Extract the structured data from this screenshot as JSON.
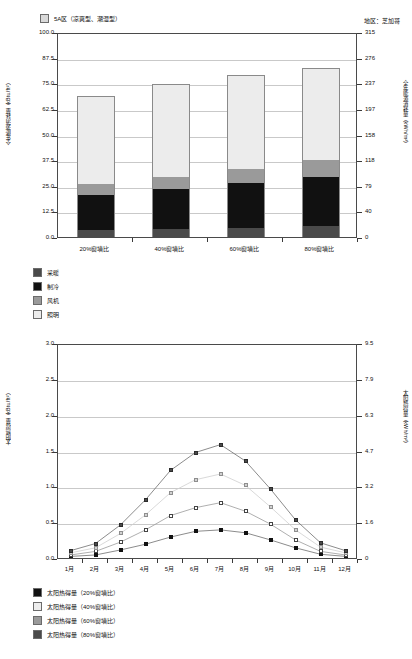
{
  "top": {
    "legend_top": {
      "swatch_color": "#d9d9d9",
      "label": "5A区（凉爽型、潮湿型）"
    },
    "region_note": "地区：芝加哥",
    "y_left_title": "全年能源消耗量（kBtu/ft²）",
    "y_right_title": "全年能源消耗量（kWh/m²）",
    "y_left_ticks": [
      "100.0",
      "87.5",
      "75.0",
      "62.5",
      "50.0",
      "37.5",
      "25.0",
      "12.5",
      "0.0"
    ],
    "y_right_ticks": [
      "315",
      "276",
      "237",
      "197",
      "158",
      "118",
      "79",
      "40",
      "0"
    ],
    "legend": [
      {
        "label": "采暖",
        "color": "#4a4a4a"
      },
      {
        "label": "制冷",
        "color": "#111111"
      },
      {
        "label": "风机",
        "color": "#9a9a9a"
      },
      {
        "label": "照明",
        "color": "#ececec"
      }
    ]
  },
  "bottom": {
    "y_left_title": "太阳热得量（kBtu/ft²）",
    "y_right_title": "太阳热得量（kWh/m²）",
    "y_left_ticks": [
      "3.0",
      "2.5",
      "2.0",
      "1.5",
      "1.0",
      "0.5",
      "0.0"
    ],
    "y_right_ticks": [
      "9.5",
      "7.9",
      "6.3",
      "4.7",
      "3.2",
      "1.6",
      "0"
    ],
    "legend": [
      {
        "label": "太阳热得量（20%窗墙比）",
        "color": "#111111"
      },
      {
        "label": "太阳热得量（40%窗墙比）",
        "color": "#ececec"
      },
      {
        "label": "太阳热得量（60%窗墙比）",
        "color": "#9a9a9a"
      },
      {
        "label": "太阳热得量（80%窗墙比）",
        "color": "#4a4a4a"
      }
    ]
  },
  "chart_data": [
    {
      "type": "bar",
      "stacked": true,
      "title": "5A区（凉爽型、潮湿型）",
      "annotation": "地区：芝加哥",
      "xlabel": "",
      "ylabel": "全年能源消耗量（kBtu/ft²）",
      "ylabel_right": "全年能源消耗量（kWh/m²）",
      "ylim": [
        0,
        100
      ],
      "ylim_right": [
        0,
        315
      ],
      "yticks": [
        0,
        12.5,
        25,
        37.5,
        50,
        62.5,
        75,
        87.5,
        100
      ],
      "yticks_right": [
        0,
        40,
        79,
        118,
        158,
        197,
        237,
        276,
        315
      ],
      "grid": true,
      "legend_position": "below-plot-left",
      "categories": [
        "20%窗墙比",
        "40%窗墙比",
        "60%窗墙比",
        "80%窗墙比"
      ],
      "series": [
        {
          "name": "采暖",
          "color": "#4a4a4a",
          "values": [
            3.5,
            4.0,
            4.6,
            5.4
          ]
        },
        {
          "name": "制冷",
          "color": "#111111",
          "values": [
            17.0,
            19.2,
            21.6,
            24.0
          ]
        },
        {
          "name": "风机",
          "color": "#9a9a9a",
          "values": [
            5.3,
            6.0,
            7.0,
            8.2
          ]
        },
        {
          "name": "照明",
          "color": "#ececec",
          "values": [
            43.2,
            45.3,
            45.8,
            45.0
          ]
        }
      ],
      "totals": [
        69.0,
        74.5,
        79.0,
        82.6
      ]
    },
    {
      "type": "line",
      "title": "",
      "xlabel": "",
      "ylabel": "太阳热得量（kBtu/ft²）",
      "ylabel_right": "太阳热得量（kWh/m²）",
      "ylim": [
        0,
        3.0
      ],
      "ylim_right": [
        0,
        9.5
      ],
      "yticks": [
        0.0,
        0.5,
        1.0,
        1.5,
        2.0,
        2.5,
        3.0
      ],
      "yticks_right": [
        0,
        1.6,
        3.2,
        4.7,
        6.3,
        7.9,
        9.5
      ],
      "grid": true,
      "legend_position": "below-plot-left",
      "x": [
        "1月",
        "2月",
        "3月",
        "4月",
        "5月",
        "6月",
        "7月",
        "8月",
        "9月",
        "10月",
        "11月",
        "12月"
      ],
      "series": [
        {
          "name": "太阳热得量（20%窗墙比）",
          "color": "#111111",
          "marker": "filled-square",
          "values": [
            0.05,
            0.07,
            0.14,
            0.22,
            0.32,
            0.4,
            0.42,
            0.38,
            0.28,
            0.17,
            0.08,
            0.05
          ]
        },
        {
          "name": "太阳热得量（40%窗墙比）",
          "color": "#ffffff",
          "marker": "open-square",
          "values": [
            0.07,
            0.12,
            0.25,
            0.42,
            0.62,
            0.73,
            0.8,
            0.68,
            0.5,
            0.28,
            0.12,
            0.07
          ]
        },
        {
          "name": "太阳热得量（60%窗墙比）",
          "color": "#bdbdbd",
          "marker": "light-square",
          "values": [
            0.1,
            0.17,
            0.37,
            0.63,
            0.94,
            1.12,
            1.2,
            1.04,
            0.74,
            0.42,
            0.18,
            0.1
          ]
        },
        {
          "name": "太阳热得量（80%窗墙比）",
          "color": "#4a4a4a",
          "marker": "dark-square",
          "values": [
            0.13,
            0.23,
            0.49,
            0.84,
            1.25,
            1.5,
            1.61,
            1.38,
            0.99,
            0.56,
            0.24,
            0.13
          ]
        }
      ]
    }
  ]
}
